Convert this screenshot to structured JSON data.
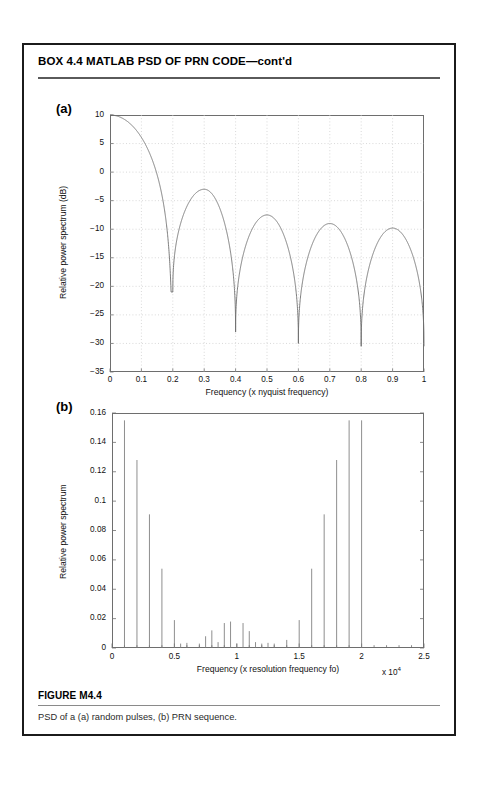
{
  "box": {
    "title": "BOX 4.4  MATLAB PSD OF PRN CODE—cont'd"
  },
  "figure": {
    "number": "FIGURE M4.4",
    "caption": "PSD of a (a) random pulses, (b) PRN sequence.",
    "panel_a_letter": "(a)",
    "panel_b_letter": "(b)"
  },
  "chart_data": [
    {
      "type": "line",
      "panel": "(a)",
      "title": "",
      "xlabel": "Frequency (x nyquist frequency)",
      "ylabel": "Relative power spectrum (dB)",
      "xlim": [
        0,
        1
      ],
      "ylim": [
        -35,
        10
      ],
      "xticks": [
        0,
        0.1,
        0.2,
        0.3,
        0.4,
        0.5,
        0.6,
        0.7,
        0.8,
        0.9,
        1
      ],
      "xtick_labels": [
        "0",
        "0.1",
        "0.2",
        "0.3",
        "0.4",
        "0.5",
        "0.6",
        "0.7",
        "0.8",
        "0.9",
        "1"
      ],
      "yticks": [
        -35,
        -30,
        -25,
        -20,
        -15,
        -10,
        -5,
        0,
        5,
        10
      ],
      "ytick_labels": [
        "-35",
        "-30",
        "-25",
        "-20",
        "-15",
        "-10",
        "-5",
        "0",
        "5",
        "10"
      ],
      "grid": true,
      "legend": null,
      "line_color": "#6e6e6e",
      "description": "Sinc-squared power spectrum of random pulses; main lobe peak 10 dB at f=0, nulls at 0.2, 0.4, 0.6, 0.8; side-lobe peaks approximately -3, -7.5, -9, -9.8 dB; null depths approximately -21, -28, -30, -30.5 dB",
      "x": [
        0,
        0.01,
        0.02,
        0.03,
        0.04,
        0.05,
        0.06,
        0.07,
        0.08,
        0.09,
        0.1,
        0.11,
        0.12,
        0.13,
        0.14,
        0.15,
        0.16,
        0.17,
        0.18,
        0.19,
        0.195,
        0.2,
        0.205,
        0.21,
        0.22,
        0.23,
        0.24,
        0.25,
        0.26,
        0.27,
        0.28,
        0.29,
        0.3,
        0.31,
        0.32,
        0.33,
        0.34,
        0.35,
        0.36,
        0.37,
        0.38,
        0.39,
        0.395,
        0.4,
        0.405,
        0.41,
        0.42,
        0.43,
        0.44,
        0.45,
        0.46,
        0.47,
        0.48,
        0.49,
        0.5,
        0.51,
        0.52,
        0.53,
        0.54,
        0.55,
        0.56,
        0.57,
        0.58,
        0.59,
        0.595,
        0.6,
        0.605,
        0.61,
        0.62,
        0.63,
        0.64,
        0.65,
        0.66,
        0.67,
        0.68,
        0.69,
        0.7,
        0.71,
        0.72,
        0.73,
        0.74,
        0.75,
        0.76,
        0.77,
        0.78,
        0.79,
        0.795,
        0.8,
        0.805,
        0.81,
        0.82,
        0.83,
        0.84,
        0.85,
        0.86,
        0.87,
        0.88,
        0.89,
        0.9,
        0.91,
        0.92,
        0.93,
        0.94,
        0.95,
        0.96,
        0.97,
        0.98,
        0.99,
        1.0
      ],
      "y": [
        10.0,
        9.99,
        9.94,
        9.87,
        9.77,
        9.64,
        9.47,
        9.27,
        9.04,
        8.76,
        8.45,
        8.09,
        7.67,
        7.2,
        6.65,
        6.03,
        5.29,
        4.41,
        3.3,
        1.73,
        0.4,
        -21.0,
        0.4,
        1.73,
        3.3,
        4.41,
        5.29,
        6.03,
        6.65,
        7.2,
        7.67,
        8.09,
        8.45,
        8.76,
        9.04,
        9.27,
        9.47,
        9.64,
        9.77,
        9.87,
        9.94,
        9.99,
        10.0,
        10.0,
        10.0,
        9.99,
        9.94,
        9.87,
        9.77,
        9.64,
        9.47,
        9.27,
        9.04,
        8.76,
        8.45,
        8.09,
        7.67,
        7.2,
        6.65,
        6.03,
        5.29,
        4.41,
        3.3,
        1.73,
        0.4,
        -21.0,
        0.4,
        1.73,
        3.3,
        4.41,
        5.29,
        6.03,
        6.65,
        7.2,
        7.67,
        8.09,
        8.45,
        8.76,
        9.04,
        9.27,
        9.47,
        9.64,
        9.77,
        9.87,
        9.94,
        9.99,
        10.0,
        10.0,
        10.0,
        9.99,
        9.94,
        9.87,
        9.77,
        9.64,
        9.47,
        9.27,
        9.04,
        8.76,
        8.45,
        8.09,
        7.67,
        7.2,
        6.65,
        6.03,
        5.29,
        4.41,
        3.3,
        1.73,
        0.4
      ],
      "sinc_model": {
        "peak_db": 10,
        "nulls": [
          0.2,
          0.4,
          0.6,
          0.8
        ],
        "sidelobe_peaks": [
          {
            "x": 0.3,
            "y": -3.0
          },
          {
            "x": 0.5,
            "y": -7.5
          },
          {
            "x": 0.7,
            "y": -9.0
          },
          {
            "x": 0.9,
            "y": -9.8
          }
        ],
        "null_depths": [
          {
            "x": 0.2,
            "y": -21.0
          },
          {
            "x": 0.4,
            "y": -28.0
          },
          {
            "x": 0.6,
            "y": -30.0
          },
          {
            "x": 0.8,
            "y": -30.5
          }
        ]
      }
    },
    {
      "type": "bar",
      "panel": "(b)",
      "title": "",
      "xlabel": "Frequency (x resolution frequency fo)",
      "ylabel": "Relative power spectrum",
      "x_exponent": "x 10",
      "x_exponent_power": "4",
      "xlim": [
        0,
        25000
      ],
      "ylim": [
        0,
        0.16
      ],
      "xticks": [
        0,
        5000,
        10000,
        15000,
        20000,
        25000
      ],
      "xtick_labels": [
        "0",
        "0.5",
        "1",
        "1.5",
        "2",
        "2.5"
      ],
      "yticks": [
        0,
        0.02,
        0.04,
        0.06,
        0.08,
        0.1,
        0.12,
        0.14,
        0.16
      ],
      "ytick_labels": [
        "0",
        "0.02",
        "0.04",
        "0.06",
        "0.08",
        "0.1",
        "0.12",
        "0.14",
        "0.16"
      ],
      "grid": false,
      "legend": null,
      "line_color": "#7a7a7a",
      "description": "Discrete line spectrum of PRN sequence; spectral lines symmetric about 10000, strongest lines near 1000 and 20000",
      "x": [
        1000,
        2000,
        3000,
        4000,
        5000,
        5500,
        6000,
        7000,
        7500,
        8000,
        8500,
        9000,
        9500,
        10000,
        10500,
        11000,
        11500,
        12000,
        12500,
        13000,
        14000,
        15000,
        16000,
        17000,
        18000,
        19000,
        20000
      ],
      "values": [
        0.155,
        0.128,
        0.091,
        0.054,
        0.019,
        0.003,
        0.0035,
        0.003,
        0.008,
        0.012,
        0.004,
        0.017,
        0.018,
        0.003,
        0.017,
        0.0115,
        0.004,
        0.003,
        0.0035,
        0.003,
        0.0055,
        0.019,
        0.054,
        0.091,
        0.128,
        0.155,
        0.155
      ]
    }
  ]
}
